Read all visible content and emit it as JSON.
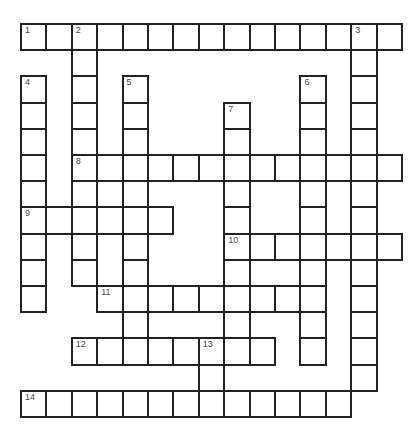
{
  "puzzle": {
    "grid": {
      "origin_x": 21,
      "origin_y": 24,
      "cell_w": 25.4,
      "cell_h": 26.2,
      "rows": 15,
      "cols": 15,
      "line_color": "#222222",
      "number_color": "#444444"
    },
    "entries": [
      {
        "number": "1",
        "direction": "across",
        "row": 0,
        "col": 0,
        "length": 15
      },
      {
        "number": "2",
        "direction": "down",
        "row": 0,
        "col": 2,
        "length": 10
      },
      {
        "number": "3",
        "direction": "down",
        "row": 0,
        "col": 13,
        "length": 14
      },
      {
        "number": "4",
        "direction": "down",
        "row": 2,
        "col": 0,
        "length": 9
      },
      {
        "number": "5",
        "direction": "down",
        "row": 2,
        "col": 4,
        "length": 11
      },
      {
        "number": "6",
        "direction": "down",
        "row": 2,
        "col": 11,
        "length": 11
      },
      {
        "number": "7",
        "direction": "down",
        "row": 3,
        "col": 8,
        "length": 10
      },
      {
        "number": "8",
        "direction": "across",
        "row": 5,
        "col": 2,
        "length": 13
      },
      {
        "number": "9",
        "direction": "across",
        "row": 7,
        "col": 0,
        "length": 6
      },
      {
        "number": "10",
        "direction": "across",
        "row": 8,
        "col": 8,
        "length": 7
      },
      {
        "number": "11",
        "direction": "across",
        "row": 10,
        "col": 3,
        "length": 9
      },
      {
        "number": "12",
        "direction": "across",
        "row": 12,
        "col": 2,
        "length": 8
      },
      {
        "number": "13",
        "direction": "down",
        "row": 12,
        "col": 7,
        "length": 3
      },
      {
        "number": "14",
        "direction": "across",
        "row": 14,
        "col": 0,
        "length": 13
      }
    ]
  }
}
